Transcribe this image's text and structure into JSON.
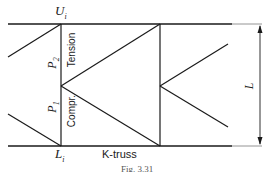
{
  "diagram": {
    "title": "K-truss",
    "caption": "Fig. 3.31",
    "nodes": {
      "upper": "U",
      "upper_sub": "i",
      "lower": "L",
      "lower_sub": "i"
    },
    "members": {
      "upper_label": "P",
      "upper_sub": "2",
      "upper_type": "Tension",
      "lower_label": "P",
      "lower_sub": "1",
      "lower_type": "Compr."
    },
    "dimension": {
      "label": "L"
    },
    "colors": {
      "line": "#1a1a1a",
      "background": "#ffffff"
    }
  }
}
